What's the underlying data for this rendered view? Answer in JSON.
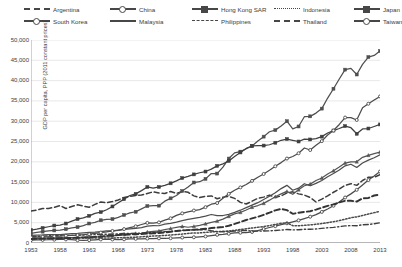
{
  "chart_data": {
    "type": "line",
    "title": "",
    "xlabel": "",
    "ylabel": "GDP per capita, PPP (2011 constant prices)",
    "xlim": [
      1953,
      2013
    ],
    "ylim": [
      0,
      50000
    ],
    "grid": true,
    "legend_position": "top",
    "x_tick_labels": [
      "1953",
      "1958",
      "1963",
      "1968",
      "1973",
      "1978",
      "1983",
      "1988",
      "1993",
      "1998",
      "2003",
      "2008",
      "2013"
    ],
    "y_tick_labels": [
      "0",
      "5,000",
      "10,000",
      "15,000",
      "20,000",
      "25,000",
      "30,000",
      "35,000",
      "40,000",
      "45,000",
      "50,000"
    ],
    "y_tick_values": [
      0,
      5000,
      10000,
      15000,
      20000,
      25000,
      30000,
      35000,
      40000,
      45000,
      50000
    ],
    "x": [
      1953,
      1954,
      1955,
      1956,
      1957,
      1958,
      1959,
      1960,
      1961,
      1962,
      1963,
      1964,
      1965,
      1966,
      1967,
      1968,
      1969,
      1970,
      1971,
      1972,
      1973,
      1974,
      1975,
      1976,
      1977,
      1978,
      1979,
      1980,
      1981,
      1982,
      1983,
      1984,
      1985,
      1986,
      1987,
      1988,
      1989,
      1990,
      1991,
      1992,
      1993,
      1994,
      1995,
      1996,
      1997,
      1998,
      1999,
      2000,
      2001,
      2002,
      2003,
      2004,
      2005,
      2006,
      2007,
      2008,
      2009,
      2010,
      2011,
      2012,
      2013
    ],
    "series": [
      {
        "name": "Argentina",
        "style": "dashed",
        "marker": "none",
        "color": "#3d3d3d",
        "values": [
          7900,
          8100,
          8500,
          8500,
          8800,
          9200,
          8500,
          9000,
          9400,
          9100,
          8800,
          9500,
          10100,
          9900,
          10200,
          10600,
          11200,
          11500,
          11700,
          11800,
          12200,
          12600,
          12300,
          12200,
          12700,
          12200,
          12700,
          12500,
          11600,
          11200,
          11500,
          11600,
          10900,
          11300,
          11500,
          11000,
          10000,
          9600,
          10300,
          11000,
          11300,
          11800,
          11200,
          11600,
          12300,
          12600,
          12100,
          11800,
          11200,
          10100,
          10800,
          11600,
          12500,
          13300,
          14200,
          14600,
          14200,
          15400,
          16200,
          16200,
          16800
        ]
      },
      {
        "name": "China",
        "style": "solid",
        "marker": "circle",
        "color": "#4a4a4a",
        "values": [
          700,
          750,
          760,
          800,
          820,
          900,
          880,
          860,
          680,
          660,
          710,
          790,
          870,
          900,
          870,
          840,
          900,
          1000,
          1030,
          1030,
          1090,
          1090,
          1150,
          1120,
          1170,
          1270,
          1340,
          1380,
          1410,
          1500,
          1620,
          1810,
          2010,
          2120,
          2280,
          2480,
          2530,
          2550,
          2720,
          3070,
          3450,
          3820,
          4150,
          4500,
          4850,
          5200,
          5580,
          6010,
          6470,
          7000,
          7660,
          8370,
          9180,
          10100,
          11200,
          12100,
          13100,
          14300,
          15500,
          16500,
          17600
        ]
      },
      {
        "name": "Hong Kong SAR",
        "style": "solid",
        "marker": "square",
        "color": "#4f4f4f",
        "values": [
          2400,
          2600,
          2800,
          3000,
          3100,
          3200,
          3400,
          3700,
          3900,
          4300,
          4800,
          5100,
          5600,
          5800,
          5900,
          6300,
          6900,
          7400,
          7700,
          8400,
          9100,
          9200,
          9200,
          10300,
          11000,
          11700,
          12800,
          13800,
          14900,
          15100,
          15800,
          17100,
          17100,
          18700,
          20800,
          22200,
          22500,
          23200,
          23900,
          25100,
          26200,
          27400,
          27800,
          28800,
          30000,
          28100,
          28700,
          31100,
          31200,
          32000,
          33100,
          35700,
          38000,
          40400,
          42700,
          43000,
          41500,
          44000,
          45800,
          46200,
          47300
        ]
      },
      {
        "name": "Indonesia",
        "style": "dotted",
        "marker": "none",
        "color": "#4a4a4a",
        "values": [
          1100,
          1120,
          1150,
          1180,
          1200,
          1170,
          1200,
          1230,
          1260,
          1220,
          1190,
          1220,
          1210,
          1220,
          1190,
          1280,
          1340,
          1400,
          1450,
          1530,
          1640,
          1730,
          1780,
          1860,
          1970,
          2090,
          2190,
          2350,
          2490,
          2490,
          2620,
          2730,
          2780,
          2870,
          2970,
          3110,
          3310,
          3520,
          3690,
          3870,
          4060,
          4300,
          4570,
          4840,
          4980,
          4270,
          4250,
          4370,
          4470,
          4610,
          4790,
          5000,
          5250,
          5520,
          5850,
          6220,
          6440,
          6790,
          7140,
          7480,
          7820
        ]
      },
      {
        "name": "Japan",
        "style": "solid",
        "marker": "square",
        "color": "#3f3f3f",
        "values": [
          3200,
          3400,
          3700,
          4000,
          4300,
          4400,
          4800,
          5400,
          5900,
          6200,
          6700,
          7300,
          7600,
          8200,
          9000,
          9900,
          10800,
          11700,
          12100,
          12900,
          13800,
          13500,
          13800,
          14200,
          14700,
          15300,
          16000,
          16400,
          16900,
          17300,
          17600,
          18200,
          19000,
          19500,
          20200,
          21300,
          22300,
          23300,
          23900,
          24000,
          24000,
          24200,
          24700,
          25300,
          25600,
          25300,
          25000,
          25600,
          25500,
          25700,
          26200,
          27100,
          27700,
          28200,
          28800,
          28400,
          26900,
          28100,
          28200,
          28700,
          29200
        ]
      },
      {
        "name": "South Korea",
        "style": "solid",
        "marker": "triangle",
        "color": "#555555",
        "values": [
          1100,
          1150,
          1200,
          1180,
          1250,
          1300,
          1320,
          1320,
          1370,
          1360,
          1450,
          1520,
          1570,
          1690,
          1780,
          1930,
          2130,
          2230,
          2340,
          2400,
          2680,
          2840,
          2970,
          3280,
          3570,
          3860,
          4070,
          3880,
          4080,
          4320,
          4700,
          5080,
          5370,
          5870,
          6560,
          7180,
          7530,
          8120,
          8810,
          9230,
          9750,
          10550,
          11400,
          12100,
          12700,
          12000,
          13100,
          14100,
          14500,
          15400,
          16000,
          17000,
          17800,
          18700,
          19700,
          20000,
          20000,
          21100,
          21600,
          22000,
          22400
        ]
      },
      {
        "name": "Malaysia",
        "style": "solid",
        "marker": "none",
        "color": "#4d4d4d",
        "values": [
          1900,
          1950,
          1980,
          2050,
          2090,
          2050,
          2180,
          2330,
          2390,
          2480,
          2600,
          2680,
          2830,
          2960,
          3000,
          3120,
          3350,
          3480,
          3590,
          3800,
          4150,
          4290,
          4250,
          4640,
          4850,
          5140,
          5490,
          5810,
          6070,
          6310,
          6620,
          7020,
          6730,
          6770,
          7050,
          7540,
          8080,
          8720,
          9330,
          9930,
          10700,
          11500,
          12400,
          13400,
          14200,
          13000,
          13500,
          14600,
          14100,
          14700,
          15400,
          16300,
          17100,
          18000,
          19000,
          19400,
          18600,
          19700,
          20400,
          21000,
          21700
        ]
      },
      {
        "name": "Philippines",
        "style": "dashdot",
        "marker": "none",
        "color": "#3f3f3f",
        "values": [
          1600,
          1640,
          1700,
          1760,
          1800,
          1820,
          1870,
          1880,
          1920,
          1950,
          2030,
          2060,
          2110,
          2150,
          2200,
          2260,
          2330,
          2360,
          2400,
          2440,
          2540,
          2620,
          2690,
          2810,
          2900,
          3000,
          3120,
          3200,
          3250,
          3270,
          3290,
          3020,
          2810,
          2770,
          2830,
          2940,
          3040,
          3070,
          2960,
          2920,
          2940,
          3000,
          3080,
          3190,
          3310,
          3230,
          3270,
          3380,
          3400,
          3460,
          3590,
          3750,
          3860,
          4020,
          4210,
          4280,
          4260,
          4490,
          4560,
          4750,
          5000
        ]
      },
      {
        "name": "Taiwan",
        "style": "solid",
        "marker": "circle",
        "color": "#4c4c4c",
        "values": [
          1400,
          1470,
          1530,
          1570,
          1650,
          1720,
          1790,
          1860,
          1950,
          2040,
          2180,
          2380,
          2570,
          2740,
          2970,
          3190,
          3430,
          3760,
          4110,
          4560,
          4950,
          4900,
          5080,
          5630,
          6080,
          6800,
          7300,
          7660,
          8000,
          8230,
          8830,
          9560,
          9840,
          11000,
          12100,
          13000,
          13700,
          14400,
          15300,
          16200,
          17000,
          17900,
          18900,
          19800,
          20800,
          21300,
          22100,
          23400,
          22900,
          24100,
          25100,
          26600,
          27700,
          29200,
          30900,
          30900,
          30300,
          33300,
          34300,
          35200,
          36100
        ]
      },
      {
        "name": "Thailand",
        "style": "dashed-thick",
        "marker": "none",
        "color": "#333333",
        "values": [
          1000,
          1030,
          1070,
          1100,
          1120,
          1130,
          1200,
          1260,
          1300,
          1370,
          1430,
          1510,
          1610,
          1760,
          1850,
          1960,
          2040,
          2110,
          2160,
          2200,
          2320,
          2390,
          2450,
          2610,
          2760,
          2950,
          3080,
          3160,
          3260,
          3370,
          3510,
          3680,
          3790,
          3930,
          4250,
          4690,
          5190,
          5660,
          6050,
          6460,
          6950,
          7470,
          8050,
          8380,
          8100,
          7190,
          7450,
          7670,
          7830,
          8220,
          8700,
          9150,
          9500,
          10000,
          10400,
          10400,
          10200,
          11000,
          11100,
          11700,
          11900
        ]
      }
    ]
  },
  "legend": {
    "rows": [
      [
        {
          "label": "Argentina",
          "style": "dashed",
          "marker": "none"
        },
        {
          "label": "China",
          "style": "solid",
          "marker": "circle"
        },
        {
          "label": "Hong Kong SAR",
          "style": "solid",
          "marker": "square"
        },
        {
          "label": "Indonesia",
          "style": "dotted",
          "marker": "none"
        },
        {
          "label": "Japan",
          "style": "solid",
          "marker": "square"
        }
      ],
      [
        {
          "label": "South Korea",
          "style": "solid",
          "marker": "triangle"
        },
        {
          "label": "Malaysia",
          "style": "solid",
          "marker": "none"
        },
        {
          "label": "Philippines",
          "style": "dashdot",
          "marker": "none"
        },
        {
          "label": "Thailand",
          "style": "dashed-thick",
          "marker": "none"
        },
        {
          "label": "Taiwan",
          "style": "solid",
          "marker": "circle"
        }
      ]
    ]
  }
}
